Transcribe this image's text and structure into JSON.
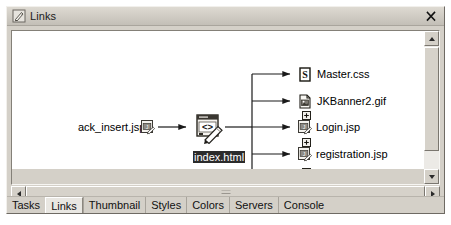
{
  "window": {
    "title": "Links",
    "title_icon": "links-pencil-icon",
    "close_label": "×"
  },
  "graph": {
    "source": {
      "label": "ack_insert.jsp",
      "icon": "jsp-file-icon"
    },
    "center": {
      "label": "index.html",
      "icon": "html-file-edit-icon",
      "selected": true
    },
    "targets": [
      {
        "label": "Master.css",
        "icon": "css-file-icon",
        "expandable": false
      },
      {
        "label": "JKBanner2.gif",
        "icon": "gif-file-icon",
        "expandable": false
      },
      {
        "label": "Login.jsp",
        "icon": "jsp-file-icon",
        "expandable": true
      },
      {
        "label": "registration.jsp",
        "icon": "jsp-file-icon",
        "expandable": true
      },
      {
        "label": "createPO.jsp",
        "icon": "jsp-file-icon",
        "expandable": true
      }
    ]
  },
  "scrollbars": {
    "vertical": {
      "up_icon": "scroll-up-arrow",
      "down_icon": "scroll-down-arrow"
    },
    "horizontal": {
      "left_icon": "scroll-left-arrow",
      "right_icon": "scroll-right-arrow"
    }
  },
  "tabs": [
    {
      "label": "Tasks",
      "active": false
    },
    {
      "label": "Links",
      "active": true
    },
    {
      "label": "Thumbnail",
      "active": false
    },
    {
      "label": "Styles",
      "active": false
    },
    {
      "label": "Colors",
      "active": false
    },
    {
      "label": "Servers",
      "active": false
    },
    {
      "label": "Console",
      "active": false
    }
  ],
  "colors": {
    "window_face": "#d4d0c8",
    "canvas": "#ffffff",
    "line": "#1a1a1a",
    "selection": "#2b2b2b"
  }
}
